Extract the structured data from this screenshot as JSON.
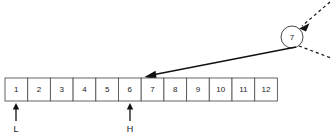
{
  "diagram": {
    "array": {
      "name": "array-cells",
      "cells": [
        {
          "label": "1"
        },
        {
          "label": "2"
        },
        {
          "label": "3"
        },
        {
          "label": "4"
        },
        {
          "label": "5"
        },
        {
          "label": "6"
        },
        {
          "label": "7"
        },
        {
          "label": "8"
        },
        {
          "label": "9"
        },
        {
          "label": "10"
        },
        {
          "label": "11"
        },
        {
          "label": "12"
        }
      ],
      "geometry": {
        "x": 5,
        "y": 78,
        "cell_width": 22.7,
        "cell_height": 23
      }
    },
    "pointers": [
      {
        "name": "low-pointer",
        "label": "L",
        "cell_index": 1,
        "x": 16,
        "arrow_top_y": 103,
        "arrow_bottom_y": 121,
        "label_y": 130
      },
      {
        "name": "high-pointer",
        "label": "H",
        "cell_index": 6,
        "x": 130,
        "arrow_top_y": 103,
        "arrow_bottom_y": 121,
        "label_y": 130
      }
    ],
    "node": {
      "name": "value-node",
      "label": "7",
      "cx": 292,
      "cy": 37,
      "r": 11
    },
    "connector": {
      "name": "node-to-array-arrow",
      "from_x": 296,
      "from_y": 47,
      "to_x": 145,
      "to_y": 77
    },
    "incoming_dashed": {
      "name": "incoming-dashed-edge",
      "from_x": 330,
      "from_y": 2,
      "to_x": 300,
      "to_y": 28
    },
    "outgoing_dashed": {
      "name": "outgoing-dashed-edge",
      "from_x": 298,
      "from_y": 46,
      "to_x": 331,
      "to_y": 58
    },
    "colors": {
      "stroke": "#111111",
      "cell_border": "#555555",
      "background": "#ffffff",
      "text": "#1a1a1a"
    }
  }
}
